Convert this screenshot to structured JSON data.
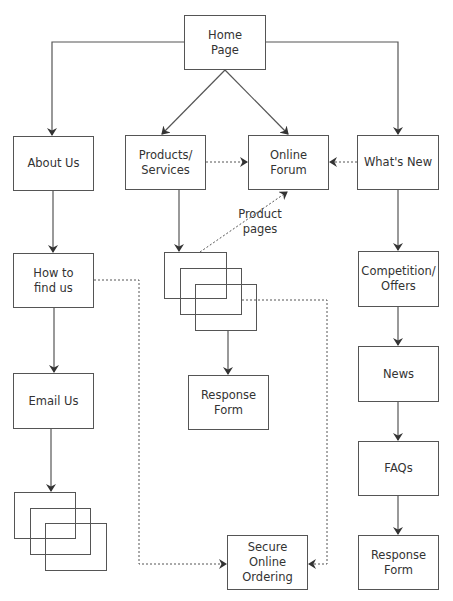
{
  "diagram": {
    "type": "site-map",
    "colors": {
      "line": "#555555",
      "text": "#333333",
      "background": "#ffffff"
    },
    "nodes": {
      "home": {
        "label": "Home\nPage"
      },
      "about": {
        "label": "About Us"
      },
      "products": {
        "label": "Products/\nServices"
      },
      "forum": {
        "label": "Online\nForum"
      },
      "whatsnew": {
        "label": "What's New"
      },
      "findus": {
        "label": "How to\nfind us"
      },
      "email": {
        "label": "Email Us"
      },
      "response_center": {
        "label": "Response\nForm"
      },
      "competition": {
        "label": "Competition/\nOffers"
      },
      "news": {
        "label": "News"
      },
      "faqs": {
        "label": "FAQs"
      },
      "response_right": {
        "label": "Response\nForm"
      },
      "ordering": {
        "label": "Secure Online\nOrdering"
      }
    },
    "annotations": {
      "product_pages": "Product\npages"
    },
    "edges": [
      {
        "from": "Home Page",
        "to": "About Us",
        "style": "solid"
      },
      {
        "from": "Home Page",
        "to": "Products/Services",
        "style": "solid"
      },
      {
        "from": "Home Page",
        "to": "Online Forum",
        "style": "solid"
      },
      {
        "from": "Home Page",
        "to": "What's New",
        "style": "solid"
      },
      {
        "from": "Products/Services",
        "to": "Online Forum",
        "style": "dashed"
      },
      {
        "from": "What's New",
        "to": "Online Forum",
        "style": "dashed"
      },
      {
        "from": "About Us",
        "to": "How to find us",
        "style": "solid"
      },
      {
        "from": "How to find us",
        "to": "Email Us",
        "style": "solid"
      },
      {
        "from": "Email Us",
        "to": "Email pages (stack)",
        "style": "solid"
      },
      {
        "from": "Products/Services",
        "to": "Product pages (stack)",
        "style": "solid"
      },
      {
        "from": "Product pages (stack)",
        "to": "Online Forum",
        "style": "dashed"
      },
      {
        "from": "Product pages (stack)",
        "to": "Response Form",
        "style": "solid"
      },
      {
        "from": "What's New",
        "to": "Competition/Offers",
        "style": "solid"
      },
      {
        "from": "Competition/Offers",
        "to": "News",
        "style": "solid"
      },
      {
        "from": "News",
        "to": "FAQs",
        "style": "solid"
      },
      {
        "from": "FAQs",
        "to": "Response Form",
        "style": "solid"
      },
      {
        "from": "How to find us",
        "to": "Secure Online Ordering",
        "style": "dashed"
      },
      {
        "from": "Product pages (stack)",
        "to": "Secure Online Ordering",
        "style": "dashed"
      }
    ]
  }
}
